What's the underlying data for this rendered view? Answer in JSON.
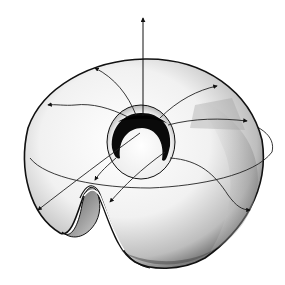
{
  "figure": {
    "type": "illustration",
    "colors": {
      "background": "#ffffff",
      "ink": "#111111",
      "shade_dark": "#555555",
      "shade_light": "#dddddd"
    },
    "elements": [
      "vertical-axis-arrow",
      "torus-surface",
      "inner-hole",
      "equatorial-ellipse",
      "flow-lines",
      "cut-fold"
    ]
  }
}
